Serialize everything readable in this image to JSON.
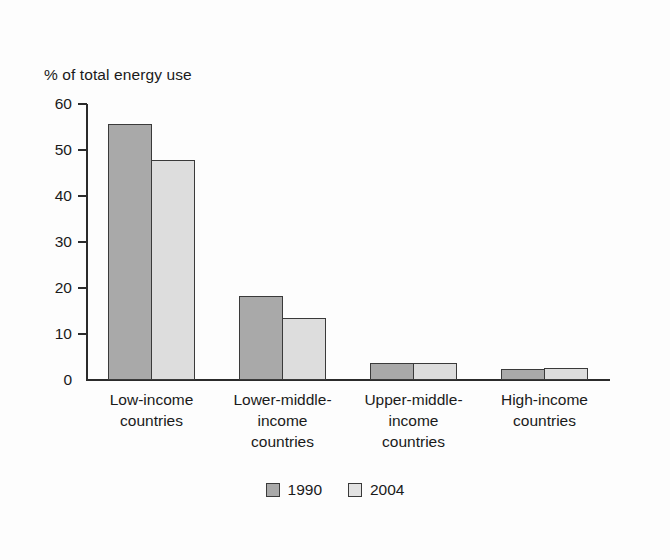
{
  "chart_data": {
    "type": "bar",
    "title": "",
    "ylabel": "% of total energy use",
    "xlabel": "",
    "ylim": [
      0,
      60
    ],
    "yticks": [
      0,
      10,
      20,
      30,
      40,
      50,
      60
    ],
    "ytick_labels": [
      "0",
      "10",
      "20",
      "30",
      "40",
      "50",
      "60"
    ],
    "grid": false,
    "legend_position": "bottom-center",
    "categories": [
      "Low-income countries",
      "Lower-middle-income countries",
      "Upper-middle-income countries",
      "High-income countries"
    ],
    "category_lines": [
      [
        "Low-income",
        "countries"
      ],
      [
        "Lower-middle-",
        "income",
        "countries"
      ],
      [
        "Upper-middle-",
        "income",
        "countries"
      ],
      [
        "High-income",
        "countries"
      ]
    ],
    "series": [
      {
        "name": "1990",
        "color": "#a9a9a9",
        "values": [
          55.7,
          18.2,
          3.6,
          2.5
        ]
      },
      {
        "name": "2004",
        "color": "#dddddd",
        "values": [
          47.8,
          13.5,
          3.7,
          2.6
        ]
      }
    ]
  },
  "legend": {
    "items": [
      {
        "label": "1990",
        "swatch": "dark-gray-swatch"
      },
      {
        "label": "2004",
        "swatch": "light-gray-swatch"
      }
    ]
  }
}
